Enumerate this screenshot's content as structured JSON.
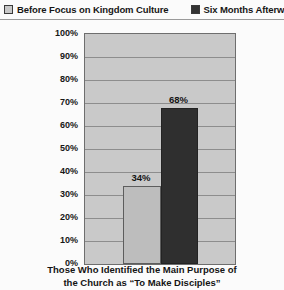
{
  "chart_data": {
    "type": "bar",
    "title": "",
    "xlabel": "Those Who Identified the Main Purpose of the Church as “To Make Disciples”",
    "ylabel": "",
    "ylim": [
      0,
      100
    ],
    "grid": true,
    "legend_position": "top",
    "categories": [
      "Those Who Identified the Main Purpose of the Church as “To Make Disciples”"
    ],
    "ytick_labels": [
      "100%",
      "90%",
      "80%",
      "70%",
      "60%",
      "50%",
      "40%",
      "30%",
      "20%",
      "10%",
      "0%"
    ],
    "ytick_values": [
      100,
      90,
      80,
      70,
      60,
      50,
      40,
      30,
      20,
      10,
      0
    ],
    "series": [
      {
        "name": "Before Focus on Kingdom Culture",
        "values": [
          34
        ],
        "data_labels": [
          "34%"
        ],
        "color": "#bdbdbd"
      },
      {
        "name": "Six Months Afterward",
        "values": [
          68
        ],
        "data_labels": [
          "68%"
        ],
        "color": "#2f2f2f"
      }
    ]
  },
  "legend": {
    "entries": [
      {
        "label": "Before Focus on Kingdom Culture",
        "swatch": "light-gray-swatch-icon"
      },
      {
        "label": "Six Months Afterward",
        "swatch": "dark-gray-swatch-icon"
      }
    ]
  },
  "caption": {
    "line1": "Those Who Identified the Main Purpose of",
    "line2": "the Church as “To Make Disciples”"
  }
}
